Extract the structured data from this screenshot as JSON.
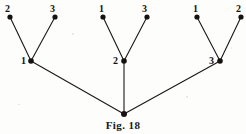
{
  "figure": {
    "caption": "Fig. 18",
    "background_color": "#fdfdfc",
    "ink_color": "#15120f"
  },
  "chart_data": {
    "type": "diagram",
    "title": "Fig. 18",
    "xlabel": "",
    "ylabel": "",
    "xlim": [
      0,
      246
    ],
    "ylim": [
      0,
      134
    ],
    "grid": false,
    "legend": null,
    "nodes": [
      {
        "id": "root",
        "label": "",
        "x": 124,
        "y": 114,
        "level": 0,
        "radius": 3.0
      },
      {
        "id": "n1",
        "label": "1",
        "x": 31,
        "y": 61,
        "level": 1,
        "radius": 2.8,
        "label_x": 21,
        "label_y": 56
      },
      {
        "id": "n2",
        "label": "2",
        "x": 124,
        "y": 61,
        "level": 1,
        "radius": 2.8,
        "label_x": 113,
        "label_y": 56
      },
      {
        "id": "n3",
        "label": "3",
        "x": 220,
        "y": 61,
        "level": 1,
        "radius": 2.8,
        "label_x": 209,
        "label_y": 56
      },
      {
        "id": "l1a",
        "label": "2",
        "x": 10,
        "y": 17,
        "level": 2,
        "radius": 2.6,
        "label_x": 5,
        "label_y": 4
      },
      {
        "id": "l1b",
        "label": "3",
        "x": 55,
        "y": 17,
        "level": 2,
        "radius": 2.6,
        "label_x": 50,
        "label_y": 4
      },
      {
        "id": "l2a",
        "label": "1",
        "x": 103,
        "y": 17,
        "level": 2,
        "radius": 2.6,
        "label_x": 99,
        "label_y": 4
      },
      {
        "id": "l2b",
        "label": "3",
        "x": 147,
        "y": 17,
        "level": 2,
        "radius": 2.6,
        "label_x": 142,
        "label_y": 4
      },
      {
        "id": "l3a",
        "label": "1",
        "x": 197,
        "y": 17,
        "level": 2,
        "radius": 2.6,
        "label_x": 193,
        "label_y": 4
      },
      {
        "id": "l3b",
        "label": "2",
        "x": 241,
        "y": 17,
        "level": 2,
        "radius": 2.6,
        "label_x": 236,
        "label_y": 4
      }
    ],
    "edges": [
      {
        "from": "root",
        "to": "n1"
      },
      {
        "from": "root",
        "to": "n2"
      },
      {
        "from": "root",
        "to": "n3"
      },
      {
        "from": "n1",
        "to": "l1a"
      },
      {
        "from": "n1",
        "to": "l1b"
      },
      {
        "from": "n2",
        "to": "l2a"
      },
      {
        "from": "n2",
        "to": "l2b"
      },
      {
        "from": "n3",
        "to": "l3a"
      },
      {
        "from": "n3",
        "to": "l3b"
      }
    ],
    "labels": [
      "2",
      "3",
      "1",
      "3",
      "1",
      "2",
      "1",
      "2",
      "3"
    ]
  }
}
